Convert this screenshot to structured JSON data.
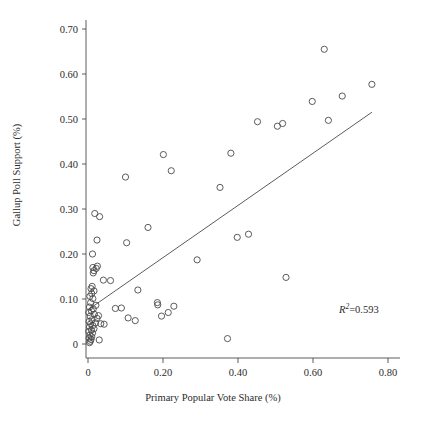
{
  "chart_data": {
    "type": "scatter",
    "title": "",
    "xlabel": "Primary Popular Vote Share (%)",
    "ylabel": "Gallup Poll Support (%)",
    "xlim": [
      -0.05,
      0.85
    ],
    "ylim": [
      -0.02,
      0.72
    ],
    "grid": false,
    "legend": "none",
    "xticks": [
      0,
      0.2,
      0.4,
      0.6,
      0.8
    ],
    "xtick_labels": [
      "0",
      "0.20",
      "0.40",
      "0.60",
      "0.80"
    ],
    "yticks": [
      0,
      0.1,
      0.2,
      0.3,
      0.4,
      0.5,
      0.6,
      0.7
    ],
    "ytick_labels": [
      "0",
      "0.10",
      "0.20",
      "0.30",
      "0.40",
      "0.50",
      "0.60",
      "0.70"
    ],
    "annotation": {
      "text": "R2=0.593",
      "r_symbol": "R",
      "exponent": "2",
      "equals_value": "=0.593",
      "r_squared": 0.593,
      "x": 0.67,
      "y": 0.082
    },
    "trendline": {
      "type": "linear",
      "x_start": 0.0,
      "y_start": 0.076,
      "x_end": 0.757,
      "y_end": 0.515
    },
    "marker": {
      "shape": "open-circle",
      "radius_px": 3.1,
      "stroke": "#4a4a4a"
    },
    "points": [
      {
        "x": 0.004,
        "y": 0.003
      },
      {
        "x": 0.006,
        "y": 0.006
      },
      {
        "x": 0.008,
        "y": 0.01
      },
      {
        "x": 0.003,
        "y": 0.013
      },
      {
        "x": 0.01,
        "y": 0.016
      },
      {
        "x": 0.005,
        "y": 0.02
      },
      {
        "x": 0.012,
        "y": 0.024
      },
      {
        "x": 0.002,
        "y": 0.028
      },
      {
        "x": 0.009,
        "y": 0.031
      },
      {
        "x": 0.016,
        "y": 0.034
      },
      {
        "x": 0.004,
        "y": 0.038
      },
      {
        "x": 0.013,
        "y": 0.041
      },
      {
        "x": 0.007,
        "y": 0.045
      },
      {
        "x": 0.02,
        "y": 0.047
      },
      {
        "x": 0.003,
        "y": 0.05
      },
      {
        "x": 0.011,
        "y": 0.054
      },
      {
        "x": 0.024,
        "y": 0.057
      },
      {
        "x": 0.006,
        "y": 0.062
      },
      {
        "x": 0.017,
        "y": 0.066
      },
      {
        "x": 0.002,
        "y": 0.07
      },
      {
        "x": 0.009,
        "y": 0.074
      },
      {
        "x": 0.014,
        "y": 0.078
      },
      {
        "x": 0.004,
        "y": 0.082
      },
      {
        "x": 0.021,
        "y": 0.086
      },
      {
        "x": 0.007,
        "y": 0.092
      },
      {
        "x": 0.013,
        "y": 0.101
      },
      {
        "x": 0.005,
        "y": 0.106
      },
      {
        "x": 0.01,
        "y": 0.112
      },
      {
        "x": 0.016,
        "y": 0.118
      },
      {
        "x": 0.008,
        "y": 0.123
      },
      {
        "x": 0.011,
        "y": 0.128
      },
      {
        "x": 0.014,
        "y": 0.158
      },
      {
        "x": 0.016,
        "y": 0.163
      },
      {
        "x": 0.013,
        "y": 0.17
      },
      {
        "x": 0.022,
        "y": 0.168
      },
      {
        "x": 0.025,
        "y": 0.173
      },
      {
        "x": 0.012,
        "y": 0.2
      },
      {
        "x": 0.024,
        "y": 0.231
      },
      {
        "x": 0.018,
        "y": 0.29
      },
      {
        "x": 0.031,
        "y": 0.283
      },
      {
        "x": 0.03,
        "y": 0.009
      },
      {
        "x": 0.034,
        "y": 0.045
      },
      {
        "x": 0.028,
        "y": 0.063
      },
      {
        "x": 0.043,
        "y": 0.044
      },
      {
        "x": 0.041,
        "y": 0.142
      },
      {
        "x": 0.06,
        "y": 0.141
      },
      {
        "x": 0.073,
        "y": 0.079
      },
      {
        "x": 0.089,
        "y": 0.08
      },
      {
        "x": 0.1,
        "y": 0.371
      },
      {
        "x": 0.103,
        "y": 0.225
      },
      {
        "x": 0.107,
        "y": 0.058
      },
      {
        "x": 0.126,
        "y": 0.052
      },
      {
        "x": 0.133,
        "y": 0.12
      },
      {
        "x": 0.16,
        "y": 0.259
      },
      {
        "x": 0.185,
        "y": 0.092
      },
      {
        "x": 0.186,
        "y": 0.087
      },
      {
        "x": 0.196,
        "y": 0.062
      },
      {
        "x": 0.201,
        "y": 0.421
      },
      {
        "x": 0.214,
        "y": 0.07
      },
      {
        "x": 0.229,
        "y": 0.084
      },
      {
        "x": 0.222,
        "y": 0.385
      },
      {
        "x": 0.291,
        "y": 0.187
      },
      {
        "x": 0.352,
        "y": 0.348
      },
      {
        "x": 0.372,
        "y": 0.012
      },
      {
        "x": 0.381,
        "y": 0.424
      },
      {
        "x": 0.398,
        "y": 0.237
      },
      {
        "x": 0.428,
        "y": 0.244
      },
      {
        "x": 0.452,
        "y": 0.494
      },
      {
        "x": 0.505,
        "y": 0.484
      },
      {
        "x": 0.519,
        "y": 0.49
      },
      {
        "x": 0.528,
        "y": 0.148
      },
      {
        "x": 0.598,
        "y": 0.539
      },
      {
        "x": 0.63,
        "y": 0.655
      },
      {
        "x": 0.641,
        "y": 0.497
      },
      {
        "x": 0.678,
        "y": 0.551
      },
      {
        "x": 0.757,
        "y": 0.577
      }
    ]
  }
}
